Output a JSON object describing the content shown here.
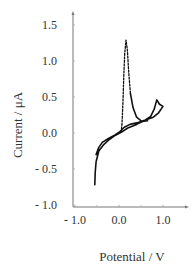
{
  "chart_data": {
    "type": "line",
    "title": "",
    "xlabel": "Potential / V",
    "ylabel": "Current / μA",
    "xlim": [
      -1.05,
      1.55
    ],
    "ylim": [
      -1.0,
      1.65
    ],
    "x_ticks": [
      -1.0,
      0.0,
      1.0
    ],
    "x_tick_labels": [
      "- 1.0",
      "0.0",
      "1.0"
    ],
    "y_ticks": [
      1.5,
      1.0,
      0.5,
      0.0,
      -0.5,
      -1.0
    ],
    "y_tick_labels": [
      "1.5",
      "1.0",
      "0.5",
      "0.0",
      "- 0.5",
      "- 1.0"
    ],
    "grid": false,
    "legend": "none",
    "series": [
      {
        "name": "solid",
        "style": "solid",
        "color": "#111111",
        "points": [
          [
            -0.55,
            -0.72
          ],
          [
            -0.54,
            -0.55
          ],
          [
            -0.52,
            -0.4
          ],
          [
            -0.46,
            -0.25
          ],
          [
            -0.36,
            -0.17
          ],
          [
            -0.22,
            -0.09
          ],
          [
            -0.08,
            -0.03
          ],
          [
            0.05,
            0.01
          ],
          [
            0.2,
            0.07
          ],
          [
            0.4,
            0.12
          ],
          [
            0.6,
            0.18
          ],
          [
            0.72,
            0.23
          ],
          [
            0.8,
            0.33
          ],
          [
            0.86,
            0.46
          ],
          [
            0.92,
            0.4
          ],
          [
            1.0,
            0.37
          ],
          [
            0.9,
            0.28
          ],
          [
            0.78,
            0.22
          ],
          [
            0.6,
            0.18
          ],
          [
            0.4,
            0.14
          ],
          [
            0.25,
            0.12
          ],
          [
            0.12,
            0.08
          ],
          [
            0.02,
            0.02
          ],
          [
            -0.1,
            -0.03
          ],
          [
            -0.25,
            -0.08
          ],
          [
            -0.38,
            -0.13
          ],
          [
            -0.46,
            -0.2
          ],
          [
            -0.52,
            -0.3
          ]
        ]
      },
      {
        "name": "dashed",
        "style": "dashed",
        "color": "#111111",
        "points": [
          [
            0.05,
            0.01
          ],
          [
            0.07,
            0.15
          ],
          [
            0.09,
            0.45
          ],
          [
            0.11,
            0.8
          ],
          [
            0.13,
            1.1
          ],
          [
            0.16,
            1.29
          ],
          [
            0.19,
            1.15
          ],
          [
            0.22,
            0.85
          ],
          [
            0.26,
            0.55
          ]
        ]
      },
      {
        "name": "solid-tail",
        "style": "solid",
        "color": "#111111",
        "points": [
          [
            0.26,
            0.55
          ],
          [
            0.32,
            0.35
          ],
          [
            0.4,
            0.22
          ],
          [
            0.52,
            0.16
          ],
          [
            0.65,
            0.17
          ]
        ]
      }
    ]
  }
}
